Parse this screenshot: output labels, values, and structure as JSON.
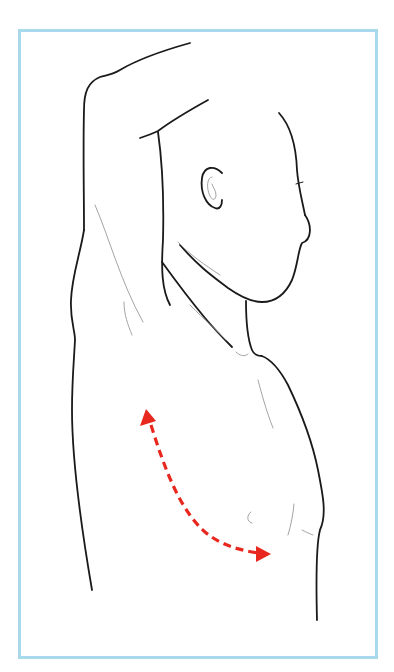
{
  "figure": {
    "colors": {
      "border": "#a9d9ec",
      "outline": "#1a1a1a",
      "detail_lines": "#9a9a9a",
      "arrow": "#e8281e",
      "background": "#ffffff"
    },
    "arrow": {
      "style": "dashed",
      "direction": "bidirectional",
      "start": [
        146,
        410
      ],
      "end": [
        270,
        555
      ]
    }
  }
}
